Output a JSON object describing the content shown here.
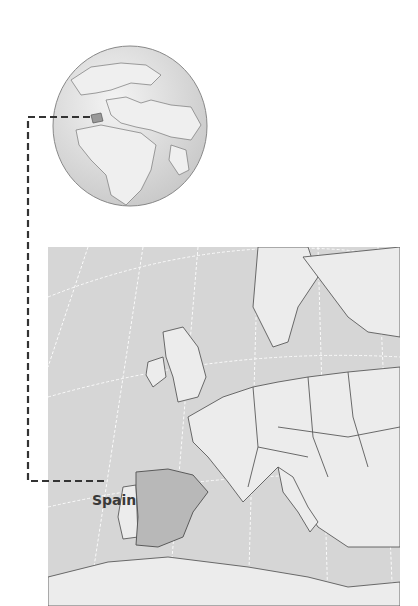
{
  "globe": {
    "region": "Europe and Africa",
    "highlight": "Spain"
  },
  "map": {
    "region": "Europe",
    "highlighted_country": "Spain",
    "label": "Spain"
  },
  "colors": {
    "sea": "#d6d6d6",
    "land": "#ececec",
    "highlight": "#b8b8b8",
    "border": "#5a5a5a",
    "graticule": "#ffffff",
    "leader_line": "#333333"
  }
}
